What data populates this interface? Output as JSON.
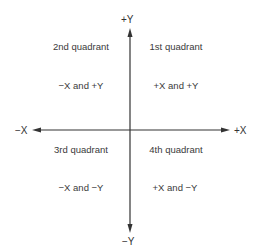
{
  "diagram": {
    "type": "coordinate-quadrants",
    "axes": {
      "pos_y": "+Y",
      "neg_y": "−Y",
      "neg_x": "−X",
      "pos_x": "+X"
    },
    "quadrants": [
      {
        "name": "2nd quadrant",
        "signs": "−X and +Y",
        "position": "top-left"
      },
      {
        "name": "1st quadrant",
        "signs": "+X and +Y",
        "position": "top-right"
      },
      {
        "name": "3rd quadrant",
        "signs": "−X and −Y",
        "position": "bottom-left"
      },
      {
        "name": "4th quadrant",
        "signs": "+X and −Y",
        "position": "bottom-right"
      }
    ],
    "colors": {
      "line": "#333333",
      "text": "#3a3a3a",
      "background": "#ffffff"
    }
  }
}
